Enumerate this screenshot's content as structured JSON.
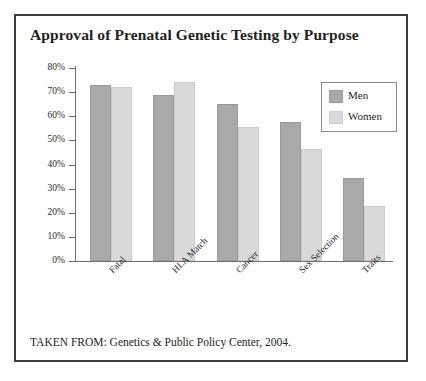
{
  "figure": {
    "title": "Approval of Prenatal Genetic Testing by Purpose",
    "source": "TAKEN FROM: Genetics & Public Policy Center, 2004.",
    "border_color": "#3b3b3b"
  },
  "legend": {
    "position": "top-right",
    "entries": [
      {
        "label": "Men",
        "color": "#a9a9a9"
      },
      {
        "label": "Women",
        "color": "#d9d9d9"
      }
    ]
  },
  "axis": {
    "y_ticks": [
      "80%",
      "70%",
      "60%",
      "50%",
      "40%",
      "30%",
      "20%",
      "10%",
      "0%"
    ]
  },
  "chart_data": {
    "type": "bar",
    "title": "Approval of Prenatal Genetic Testing by Purpose",
    "xlabel": "",
    "ylabel": "",
    "ylim": [
      0,
      80
    ],
    "ytick_values": [
      80,
      70,
      60,
      50,
      40,
      30,
      20,
      10,
      0
    ],
    "ytick_labels": [
      "80%",
      "70%",
      "60%",
      "50%",
      "40%",
      "30%",
      "20%",
      "10%",
      "0%"
    ],
    "grid": false,
    "legend_position": "upper right",
    "categories": [
      "Fatal",
      "HLA Match",
      "Cancer",
      "Sex Selection",
      "Traits"
    ],
    "series": [
      {
        "name": "Men",
        "color": "#a9a9a9",
        "values": [
          73,
          69,
          65,
          57.5,
          34.5
        ]
      },
      {
        "name": "Women",
        "color": "#d9d9d9",
        "values": [
          72,
          74,
          55.5,
          46.5,
          23
        ]
      }
    ],
    "annotations": [
      "TAKEN FROM: Genetics & Public Policy Center, 2004."
    ]
  }
}
